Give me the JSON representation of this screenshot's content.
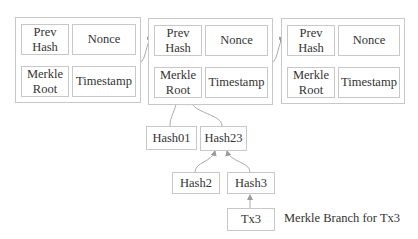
{
  "blocks": [
    {
      "prev_hash": "Prev\nHash",
      "nonce": "Nonce",
      "merkle_root": "Merkle\nRoot",
      "timestamp": "Timestamp"
    },
    {
      "prev_hash": "Prev\nHash",
      "nonce": "Nonce",
      "merkle_root": "Merkle\nRoot",
      "timestamp": "Timestamp"
    },
    {
      "prev_hash": "Prev\nHash",
      "nonce": "Nonce",
      "merkle_root": "Merkle\nRoot",
      "timestamp": "Timestamp"
    }
  ],
  "merkle_tree": {
    "hash01": "Hash01",
    "hash23": "Hash23",
    "hash2": "Hash2",
    "hash3": "Hash3",
    "tx3": "Tx3"
  },
  "caption": "Merkle Branch for Tx3",
  "colors": {
    "border": "#c8c8c8",
    "arrow": "#9a9a9a",
    "text": "#333333"
  }
}
